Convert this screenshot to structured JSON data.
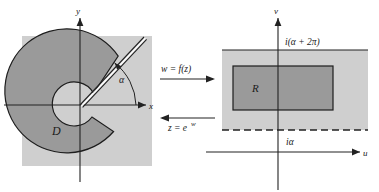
{
  "figure": {
    "background_color": "#ffffff",
    "panel_fill": "#cfcfcf",
    "region_fill": "#9a9a9a",
    "outline_color": "#1d1d1d",
    "axis_color": "#222222"
  },
  "left_panel": {
    "name": "z-plane",
    "axis_x_label": "x",
    "axis_y_label": "y",
    "region_label": "D",
    "angle_label": "α",
    "slit_description": "dashed ray at angle alpha"
  },
  "right_panel": {
    "name": "w-plane",
    "axis_u_label": "u",
    "axis_v_label": "v",
    "region_label": "R",
    "top_line_label": "i(α + 2π)",
    "bottom_line_label": "iα"
  },
  "center": {
    "forward_map_label": "w = f(z)",
    "inverse_map_label": "z = e",
    "inverse_map_exponent": "w"
  }
}
